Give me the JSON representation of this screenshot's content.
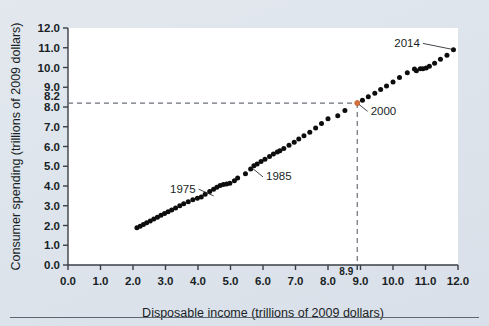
{
  "chart_data": {
    "type": "scatter",
    "title": "",
    "xlabel": "Disposable income (trillions of 2009 dollars)",
    "ylabel": "Consumer spending (trillions of 2009 dollars)",
    "xlim": [
      0.0,
      12.0
    ],
    "ylim": [
      0.0,
      12.0
    ],
    "grid": false,
    "legend": null,
    "xticks": [
      "0.0",
      "1.0",
      "2.0",
      "3.0",
      "4.0",
      "5.0",
      "6.0",
      "7.0",
      "8.0",
      "9.0",
      "10.0",
      "11.0",
      "12.0"
    ],
    "yticks": [
      "0.0",
      "1.0",
      "2.0",
      "3.0",
      "4.0",
      "5.0",
      "6.0",
      "7.0",
      "8.0",
      "9.0",
      "10.0",
      "11.0",
      "12.0"
    ],
    "xtick_values": [
      0,
      1,
      2,
      3,
      4,
      5,
      6,
      7,
      8,
      9,
      10,
      11,
      12
    ],
    "ytick_values": [
      0,
      1,
      2,
      3,
      4,
      5,
      6,
      7,
      8,
      9,
      10,
      11,
      12
    ],
    "special_xtick": {
      "label": "8.9",
      "value": 8.9
    },
    "special_ytick": {
      "label": "8.2",
      "value": 8.2
    },
    "points": [
      {
        "x": 2.12,
        "y": 1.88
      },
      {
        "x": 2.22,
        "y": 1.96
      },
      {
        "x": 2.32,
        "y": 2.05
      },
      {
        "x": 2.42,
        "y": 2.14
      },
      {
        "x": 2.53,
        "y": 2.23
      },
      {
        "x": 2.64,
        "y": 2.33
      },
      {
        "x": 2.75,
        "y": 2.42
      },
      {
        "x": 2.86,
        "y": 2.52
      },
      {
        "x": 2.97,
        "y": 2.61
      },
      {
        "x": 3.08,
        "y": 2.7
      },
      {
        "x": 3.19,
        "y": 2.78
      },
      {
        "x": 3.31,
        "y": 2.89
      },
      {
        "x": 3.44,
        "y": 3.0
      },
      {
        "x": 3.56,
        "y": 3.1
      },
      {
        "x": 3.7,
        "y": 3.2
      },
      {
        "x": 3.84,
        "y": 3.3
      },
      {
        "x": 3.98,
        "y": 3.38
      },
      {
        "x": 4.1,
        "y": 3.44
      },
      {
        "x": 4.22,
        "y": 3.58
      },
      {
        "x": 4.36,
        "y": 3.72
      },
      {
        "x": 4.48,
        "y": 3.84
      },
      {
        "x": 4.58,
        "y": 3.94
      },
      {
        "x": 4.68,
        "y": 4.02
      },
      {
        "x": 4.78,
        "y": 4.07
      },
      {
        "x": 4.88,
        "y": 4.1
      },
      {
        "x": 4.98,
        "y": 4.14
      },
      {
        "x": 5.12,
        "y": 4.26
      },
      {
        "x": 5.22,
        "y": 4.4
      },
      {
        "x": 5.46,
        "y": 4.62
      },
      {
        "x": 5.62,
        "y": 4.86
      },
      {
        "x": 5.72,
        "y": 5.02
      },
      {
        "x": 5.82,
        "y": 5.12
      },
      {
        "x": 5.94,
        "y": 5.24
      },
      {
        "x": 6.06,
        "y": 5.36
      },
      {
        "x": 6.2,
        "y": 5.5
      },
      {
        "x": 6.32,
        "y": 5.62
      },
      {
        "x": 6.44,
        "y": 5.72
      },
      {
        "x": 6.52,
        "y": 5.78
      },
      {
        "x": 6.64,
        "y": 5.9
      },
      {
        "x": 6.8,
        "y": 6.06
      },
      {
        "x": 6.96,
        "y": 6.22
      },
      {
        "x": 7.1,
        "y": 6.38
      },
      {
        "x": 7.26,
        "y": 6.54
      },
      {
        "x": 7.44,
        "y": 6.72
      },
      {
        "x": 7.62,
        "y": 6.94
      },
      {
        "x": 7.8,
        "y": 7.16
      },
      {
        "x": 8.0,
        "y": 7.4
      },
      {
        "x": 8.3,
        "y": 7.56
      },
      {
        "x": 8.52,
        "y": 7.82
      },
      {
        "x": 8.9,
        "y": 8.2
      },
      {
        "x": 9.06,
        "y": 8.34
      },
      {
        "x": 9.24,
        "y": 8.52
      },
      {
        "x": 9.44,
        "y": 8.7
      },
      {
        "x": 9.62,
        "y": 8.88
      },
      {
        "x": 9.8,
        "y": 9.06
      },
      {
        "x": 10.0,
        "y": 9.26
      },
      {
        "x": 10.2,
        "y": 9.5
      },
      {
        "x": 10.44,
        "y": 9.74
      },
      {
        "x": 10.66,
        "y": 9.92
      },
      {
        "x": 10.72,
        "y": 9.84
      },
      {
        "x": 10.84,
        "y": 9.94
      },
      {
        "x": 10.92,
        "y": 9.94
      },
      {
        "x": 11.02,
        "y": 9.98
      },
      {
        "x": 11.12,
        "y": 10.06
      },
      {
        "x": 11.28,
        "y": 10.22
      },
      {
        "x": 11.46,
        "y": 10.42
      },
      {
        "x": 11.66,
        "y": 10.62
      },
      {
        "x": 11.86,
        "y": 10.9
      }
    ],
    "highlighted_point": {
      "x": 8.9,
      "y": 8.2,
      "color": "#d4703a",
      "label": "2000"
    },
    "annotations": [
      {
        "label": "1975",
        "text_x": 4.02,
        "text_y": 3.84,
        "point_x": 4.48,
        "point_y": 3.5
      },
      {
        "label": "1985",
        "text_x": 6.0,
        "text_y": 4.46,
        "point_x": 5.66,
        "point_y": 4.92
      },
      {
        "label": "2000",
        "text_x": 9.22,
        "text_y": 7.78,
        "point_x": 8.96,
        "point_y": 8.12
      },
      {
        "label": "2014",
        "text_x": 10.92,
        "text_y": 11.22,
        "point_x": 11.82,
        "point_y": 10.92
      }
    ],
    "reference_lines": [
      {
        "orientation": "horizontal",
        "value": 8.2,
        "style": "dashed",
        "color": "#6a7079"
      },
      {
        "orientation": "vertical",
        "value": 8.9,
        "style": "dashed",
        "color": "#6a7079"
      }
    ],
    "colors": {
      "background": "#dfe5ec",
      "plot_background": "#ffffff",
      "point": "#0d0d0d",
      "axis": "#3a3f46",
      "text": "#1a1f26",
      "highlight": "#d4703a",
      "rule": "#5d6773"
    }
  }
}
